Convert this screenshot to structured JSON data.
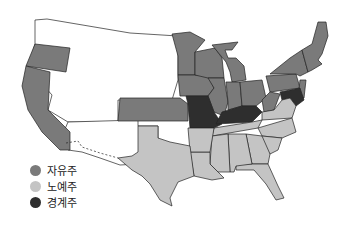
{
  "colors": {
    "free": "#7a7a7a",
    "slave": "#c4c4c4",
    "border": "#2e2e2e",
    "territory": "#ffffff"
  },
  "legend": [
    {
      "label": "자유주",
      "category": "free"
    },
    {
      "label": "노예주",
      "category": "slave"
    },
    {
      "label": "경계주",
      "category": "border"
    }
  ]
}
